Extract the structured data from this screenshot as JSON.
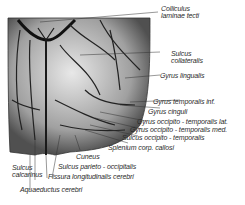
{
  "figure": {
    "type": "anatomical-illustration",
    "labels": [
      {
        "id": "colliculus",
        "line1": "Colliculus",
        "line2": "laminae tecti"
      },
      {
        "id": "sulcus-collateralis",
        "line1": "Sulcus",
        "line2": "collateralis"
      },
      {
        "id": "gyrus-lingualis",
        "text": "Gyrus lingualis"
      },
      {
        "id": "gyrus-temporalis-inf",
        "text": "Gyrus temporalis inf."
      },
      {
        "id": "gyrus-cinguli",
        "text": "Gyrus cinguli"
      },
      {
        "id": "gyrus-ot-lat",
        "text": "Gyrus occipito - temporalis lat."
      },
      {
        "id": "gyrus-ot-med",
        "text": "Gyrus occipito - temporalis med."
      },
      {
        "id": "sulcus-ot",
        "text": "Sulcus occipito - temporalis"
      },
      {
        "id": "splenium",
        "text": "Splenium corp. callosi"
      },
      {
        "id": "cuneus",
        "text": "Cuneus"
      },
      {
        "id": "sulcus-calcarinus",
        "line1": "Sulcus",
        "line2": "calcarinus"
      },
      {
        "id": "sulcus-po",
        "text": "Sulcus parieto - occipitalis"
      },
      {
        "id": "fissura",
        "text": "Fissura longitudinalis cerebri"
      },
      {
        "id": "aquaeductus",
        "text": "Aquaeductus cerebri"
      }
    ]
  }
}
